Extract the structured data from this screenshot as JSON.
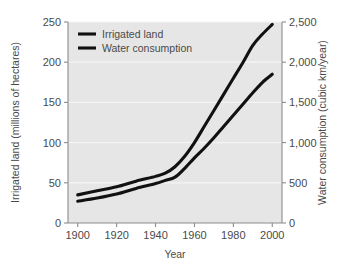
{
  "chart_data": {
    "type": "line",
    "title": "",
    "subtitle": "",
    "xlabel": "Year",
    "ylabel": "Irrigated land (millions of hectares)",
    "y2label": "Water consumption (cubic km/year)",
    "xlim": [
      1895,
      2005
    ],
    "ylim": [
      0,
      250
    ],
    "y2lim": [
      0,
      2500
    ],
    "grid": true,
    "grid_orientation": "horizontal",
    "legend_position": "top-left",
    "plot_background": "#e6e6e6",
    "line_color": "#111111",
    "x": [
      1900,
      1910,
      1920,
      1930,
      1940,
      1945,
      1950,
      1955,
      1960,
      1965,
      1970,
      1975,
      1980,
      1985,
      1990,
      1995,
      2000
    ],
    "series": [
      {
        "name": "Irrigated land",
        "axis": "left",
        "units": "millions of hectares",
        "values": [
          35,
          40,
          45,
          52,
          58,
          62,
          70,
          83,
          100,
          120,
          140,
          160,
          180,
          200,
          221,
          235,
          247
        ]
      },
      {
        "name": "Water consumption",
        "axis": "right",
        "units": "cubic km/year",
        "values": [
          270,
          310,
          360,
          430,
          490,
          530,
          570,
          680,
          810,
          930,
          1060,
          1200,
          1340,
          1480,
          1620,
          1750,
          1850
        ]
      }
    ],
    "x_ticks": [
      1900,
      1920,
      1940,
      1960,
      1980,
      2000
    ],
    "x_tick_labels": [
      "1900",
      "1920",
      "1940",
      "1960",
      "1980",
      "2000"
    ],
    "y_ticks": [
      0,
      50,
      100,
      150,
      200,
      250
    ],
    "y_tick_labels": [
      "0",
      "50",
      "100",
      "150",
      "200",
      "250"
    ],
    "y2_ticks": [
      0,
      500,
      1000,
      1500,
      2000,
      2500
    ],
    "y2_tick_labels": [
      "0",
      "500",
      "1,000",
      "1,500",
      "2,000",
      "2,500"
    ],
    "legend_entries": [
      {
        "label": "Irrigated land"
      },
      {
        "label": "Water consumption"
      }
    ]
  }
}
